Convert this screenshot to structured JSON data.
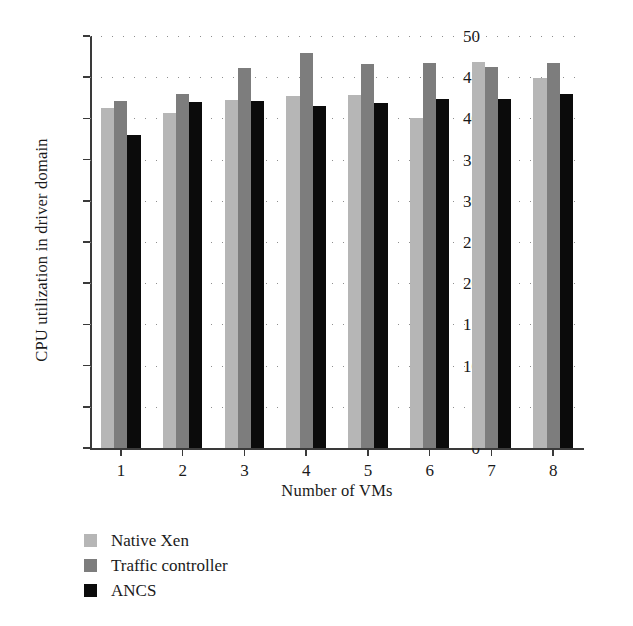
{
  "chart_data": {
    "type": "bar",
    "title": "",
    "xlabel": "Number of VMs",
    "ylabel": "CPU utilization in driver domain",
    "categories": [
      "1",
      "2",
      "3",
      "4",
      "5",
      "6",
      "7",
      "8"
    ],
    "series": [
      {
        "name": "Native Xen",
        "color": "#b6b6b6",
        "values": [
          41.3,
          40.7,
          42.2,
          42.7,
          42.9,
          40.0,
          46.9,
          44.9
        ]
      },
      {
        "name": "Traffic controller",
        "color": "#7d7d7d",
        "values": [
          42.1,
          43.0,
          46.1,
          47.9,
          46.6,
          46.7,
          46.2,
          46.7
        ]
      },
      {
        "name": "ANCS",
        "color": "#0b0b0b",
        "values": [
          38.0,
          42.0,
          42.1,
          41.5,
          41.9,
          42.3,
          42.4,
          43.0
        ]
      }
    ],
    "ylim": [
      0,
      50
    ],
    "yticks": [
      0,
      5,
      10,
      15,
      20,
      25,
      30,
      35,
      40,
      45,
      50
    ],
    "ytick_labels": [
      "0",
      "5",
      "10",
      "15",
      "20",
      "25",
      "30",
      "35",
      "40",
      "45",
      "50"
    ],
    "grid": "horizontal-dotted",
    "legend_position": "below-left",
    "legend": [
      "Native Xen",
      "Traffic controller",
      "ANCS"
    ]
  }
}
